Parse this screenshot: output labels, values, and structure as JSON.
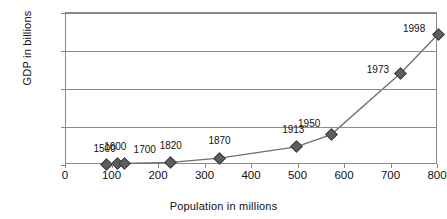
{
  "chart_data": {
    "type": "line",
    "title": "",
    "xlabel": "Population in millions",
    "ylabel": "GDP in billions",
    "xlim": [
      0,
      800
    ],
    "ylim": [
      0,
      10000
    ],
    "grid": true,
    "legend": "none",
    "xticks": [
      "0",
      "100",
      "200",
      "300",
      "400",
      "500",
      "600",
      "700",
      "800"
    ],
    "xtick_values": [
      0,
      100,
      200,
      300,
      400,
      500,
      600,
      700,
      800
    ],
    "yticks": [
      "0",
      "2,500",
      "5,000",
      "7,500",
      "10,000"
    ],
    "ytick_values": [
      0,
      2500,
      5000,
      7500,
      10000
    ],
    "series": [
      {
        "name": "GDP vs Population",
        "marker": "diamond",
        "color": "#5e5e5e",
        "line_color": "#6e6e6e",
        "points": [
          {
            "label": "1500",
            "x": 87,
            "y": 60,
            "label_dx": -2,
            "label_dy": -15
          },
          {
            "label": "1600",
            "x": 110,
            "y": 80,
            "label_dx": -2,
            "label_dy": -17
          },
          {
            "label": "1700",
            "x": 126,
            "y": 100,
            "label_dx": 20,
            "label_dy": -13
          },
          {
            "label": "1820",
            "x": 225,
            "y": 170,
            "label_dx": 0,
            "label_dy": -16
          },
          {
            "label": "1870",
            "x": 330,
            "y": 450,
            "label_dx": 0,
            "label_dy": -17
          },
          {
            "label": "1913",
            "x": 495,
            "y": 1200,
            "label_dx": -3,
            "label_dy": -17
          },
          {
            "label": "1950",
            "x": 570,
            "y": 2000,
            "label_dx": -22,
            "label_dy": -11
          },
          {
            "label": "1973",
            "x": 720,
            "y": 6050,
            "label_dx": -23,
            "label_dy": -3
          },
          {
            "label": "1998",
            "x": 800,
            "y": 8600,
            "label_dx": -24,
            "label_dy": -5
          }
        ]
      }
    ]
  },
  "colors": {
    "marker": "#5e5e5e",
    "line": "#6e6e6e",
    "axis": "#8a8a8a",
    "text": "#111111",
    "background": "#ffffff"
  }
}
